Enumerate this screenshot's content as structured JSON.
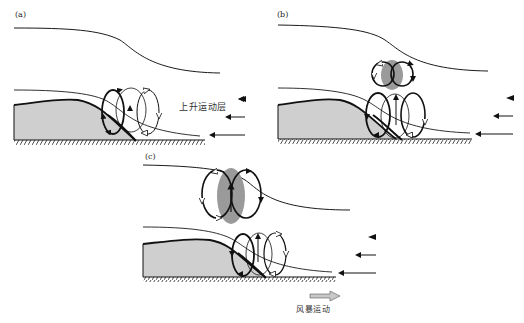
{
  "figure": {
    "panels": [
      {
        "id": "a",
        "label": "(a)"
      },
      {
        "id": "b",
        "label": "(b)"
      },
      {
        "id": "c",
        "label": "(c)"
      }
    ],
    "annotations": {
      "lifting_layer": "上升运动层",
      "storm_motion": "风暴运动"
    },
    "colors": {
      "line": "#1a1a1a",
      "cold_pool_fill": "#cfcfcf",
      "updraft_core_fill": "#9a9a9a",
      "storm_arrow_fill": "#c8c8c8"
    }
  }
}
